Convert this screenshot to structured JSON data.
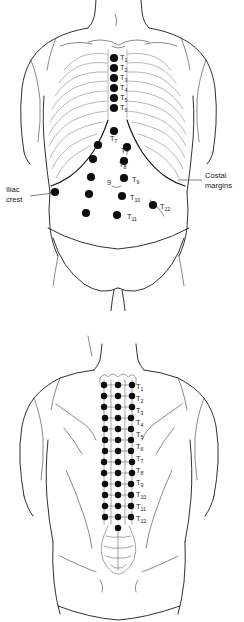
{
  "figure": {
    "panels": [
      {
        "id": "anterior",
        "name": "anterior-view"
      },
      {
        "id": "posterior",
        "name": "posterior-view"
      }
    ]
  },
  "anterior": {
    "callouts": {
      "costal_margins_line1": "Costal",
      "costal_margins_line2": "margins",
      "iliac_crest_line1": "Iliac",
      "iliac_crest_line2": "crest"
    },
    "sternal_labels": [
      {
        "base": "T",
        "sub": "1",
        "x": 120,
        "y": 60
      },
      {
        "base": "T",
        "sub": "2",
        "x": 120,
        "y": 70
      },
      {
        "base": "T",
        "sub": "3",
        "x": 120,
        "y": 80
      },
      {
        "base": "T",
        "sub": "4",
        "x": 120,
        "y": 90
      },
      {
        "base": "T",
        "sub": "5",
        "x": 120,
        "y": 100
      },
      {
        "base": "T",
        "sub": "6",
        "x": 120,
        "y": 110
      }
    ],
    "sternal_dots": [
      {
        "x": 114,
        "y": 58
      },
      {
        "x": 114,
        "y": 68
      },
      {
        "x": 114,
        "y": 78
      },
      {
        "x": 114,
        "y": 88
      },
      {
        "x": 114,
        "y": 98
      },
      {
        "x": 114,
        "y": 108
      }
    ],
    "abdominal_labels": [
      {
        "base": "T",
        "sub": "7",
        "x": 110,
        "y": 141
      },
      {
        "base": "T",
        "sub": "7",
        "x": 121,
        "y": 153
      },
      {
        "base": "T",
        "sub": "8",
        "x": 119,
        "y": 167
      },
      {
        "base": "9",
        "sub": "",
        "x": 107,
        "y": 185
      },
      {
        "base": "T",
        "sub": "9",
        "x": 132,
        "y": 182
      },
      {
        "base": "T",
        "sub": "10",
        "x": 130,
        "y": 200
      },
      {
        "base": "T",
        "sub": "11",
        "x": 127,
        "y": 219
      },
      {
        "base": "T",
        "sub": "12",
        "x": 160,
        "y": 209
      }
    ],
    "abdominal_dots": [
      {
        "x": 114,
        "y": 131
      },
      {
        "x": 98,
        "y": 145
      },
      {
        "x": 127,
        "y": 147
      },
      {
        "x": 93,
        "y": 159
      },
      {
        "x": 124,
        "y": 161
      },
      {
        "x": 91,
        "y": 177
      },
      {
        "x": 124,
        "y": 178
      },
      {
        "x": 89,
        "y": 194
      },
      {
        "x": 122,
        "y": 196
      },
      {
        "x": 86,
        "y": 213
      },
      {
        "x": 117,
        "y": 215
      },
      {
        "x": 153,
        "y": 205
      },
      {
        "x": 55,
        "y": 192
      }
    ]
  },
  "posterior": {
    "vertebral_labels": [
      {
        "base": "T",
        "sub": "1",
        "x": 136,
        "y": 389
      },
      {
        "base": "T",
        "sub": "2",
        "x": 136,
        "y": 401
      },
      {
        "base": "T",
        "sub": "3",
        "x": 136,
        "y": 413
      },
      {
        "base": "T",
        "sub": "4",
        "x": 136,
        "y": 425
      },
      {
        "base": "T",
        "sub": "5",
        "x": 136,
        "y": 437
      },
      {
        "base": "T",
        "sub": "6",
        "x": 136,
        "y": 449
      },
      {
        "base": "T",
        "sub": "7",
        "x": 136,
        "y": 461
      },
      {
        "base": "T",
        "sub": "8",
        "x": 136,
        "y": 473
      },
      {
        "base": "T",
        "sub": "9",
        "x": 136,
        "y": 485
      },
      {
        "base": "T",
        "sub": "10",
        "x": 136,
        "y": 497
      },
      {
        "base": "T",
        "sub": "11",
        "x": 136,
        "y": 509
      },
      {
        "base": "T",
        "sub": "12",
        "x": 136,
        "y": 521
      }
    ],
    "dot_rows": [
      {
        "y": 385,
        "xs": [
          104,
          118,
          132
        ]
      },
      {
        "y": 396,
        "xs": [
          104,
          118,
          132
        ]
      },
      {
        "y": 407,
        "xs": [
          104,
          118,
          132
        ]
      },
      {
        "y": 418,
        "xs": [
          105,
          118,
          131
        ]
      },
      {
        "y": 429,
        "xs": [
          105,
          118,
          131
        ]
      },
      {
        "y": 440,
        "xs": [
          105,
          118,
          131
        ]
      },
      {
        "y": 451,
        "xs": [
          105,
          118,
          131
        ]
      },
      {
        "y": 462,
        "xs": [
          104,
          118,
          132
        ]
      },
      {
        "y": 473,
        "xs": [
          104,
          118,
          132
        ]
      },
      {
        "y": 484,
        "xs": [
          105,
          118,
          131
        ]
      },
      {
        "y": 495,
        "xs": [
          105,
          118,
          131
        ]
      },
      {
        "y": 506,
        "xs": [
          105,
          118,
          131
        ]
      },
      {
        "y": 517,
        "xs": [
          105,
          118,
          131
        ]
      },
      {
        "y": 528,
        "xs": [
          118
        ]
      }
    ]
  },
  "style": {
    "ink": "#1a1a1a",
    "dot_fill": "#0d0d0d",
    "rib_stroke": "#7a7a7a",
    "background": "#ffffff"
  }
}
